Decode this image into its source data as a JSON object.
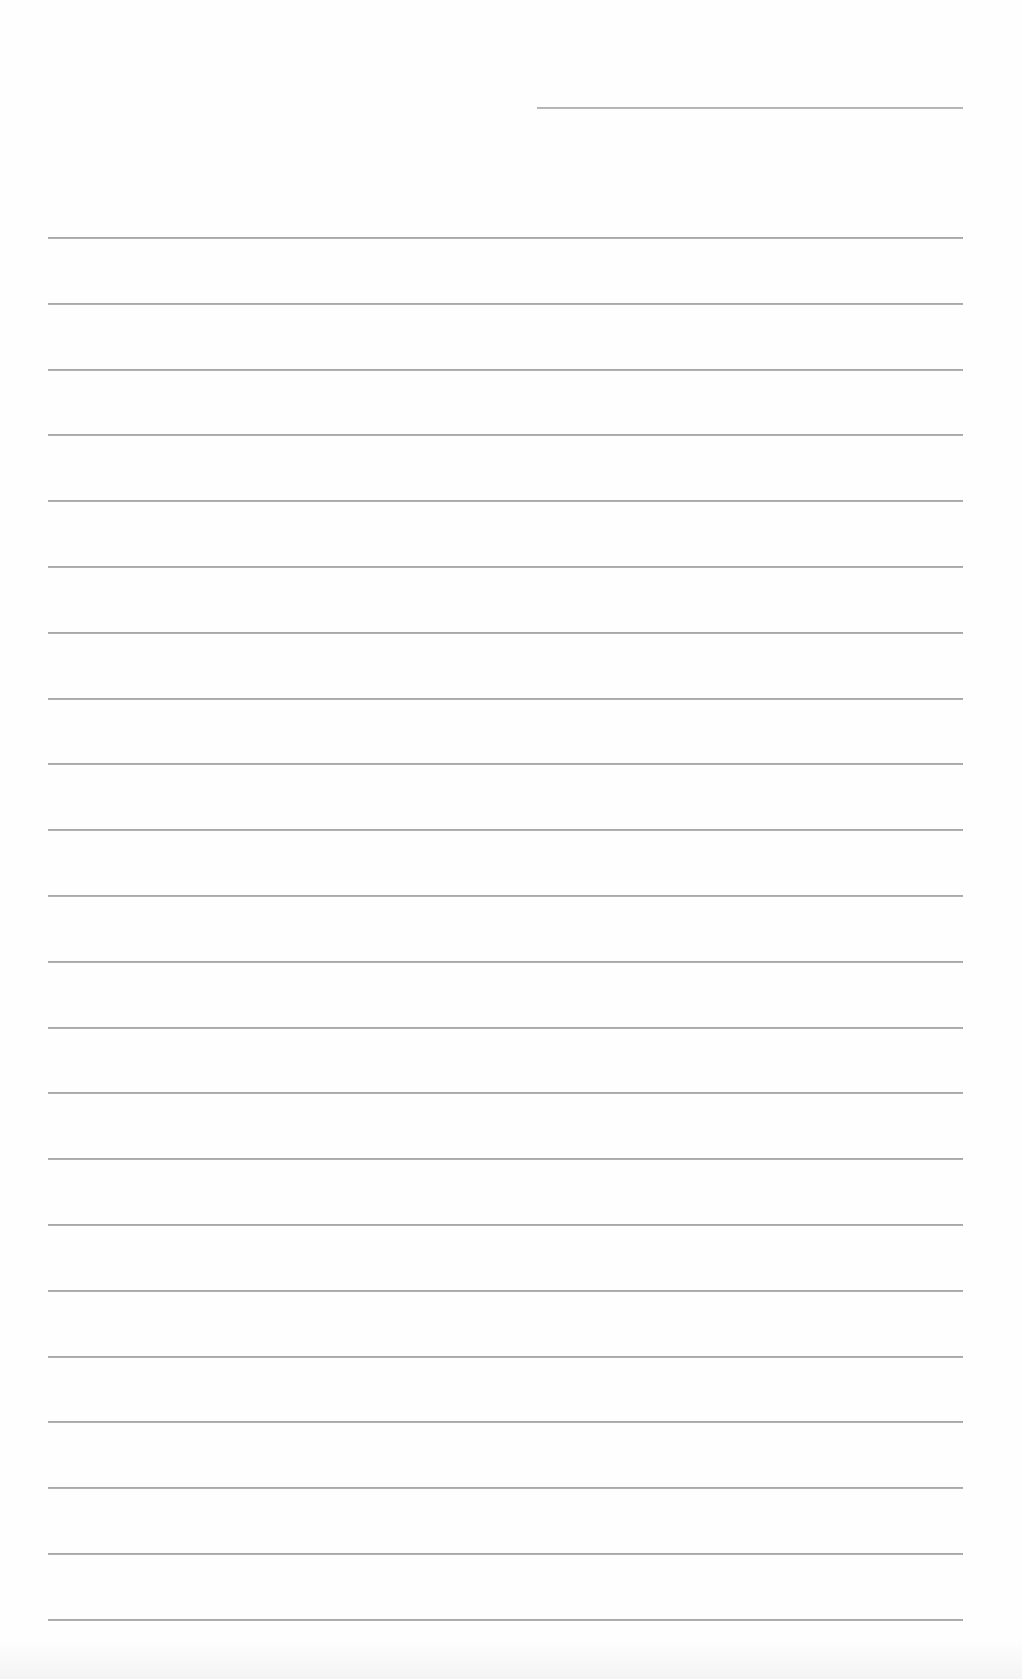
{
  "document": {
    "type": "ruled-sheet",
    "background": "#fefefe",
    "line_color": "#9a9a9a",
    "header_line": {
      "left": 537,
      "right": 963,
      "y": 107
    },
    "body_lines": {
      "left": 48,
      "right": 963,
      "first_y": 237,
      "spacing": 65.8,
      "count": 22
    }
  }
}
